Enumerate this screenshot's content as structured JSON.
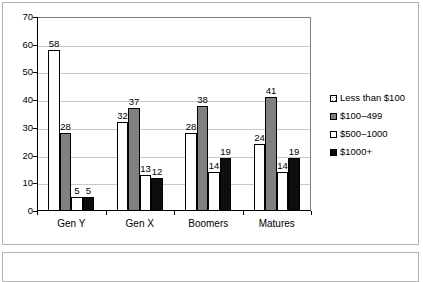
{
  "chart_data": {
    "type": "bar",
    "title": "",
    "subtitle": "",
    "xlabel": "",
    "ylabel": "",
    "ylim": [
      0,
      70
    ],
    "ytick_step": 10,
    "yticks": [
      "70",
      "60",
      "50",
      "40",
      "30",
      "20",
      "10",
      "0"
    ],
    "grid": true,
    "legend_position": "right",
    "categories": [
      "Gen Y",
      "Gen X",
      "Boomers",
      "Matures"
    ],
    "series": [
      {
        "name": "Less than $100",
        "swatch": "dotted-white",
        "color": "#ffffff",
        "values": [
          58,
          32,
          28,
          24
        ]
      },
      {
        "name": "$100–499",
        "swatch": "solid-gray",
        "color": "#808080",
        "values": [
          28,
          37,
          38,
          41
        ]
      },
      {
        "name": "$500–1000",
        "swatch": "solid-white",
        "color": "#ffffff",
        "values": [
          5,
          13,
          14,
          14
        ]
      },
      {
        "name": "$1000+",
        "swatch": "solid-black",
        "color": "#0d0d0d",
        "values": [
          5,
          12,
          19,
          19
        ]
      }
    ]
  },
  "figure": {
    "border_color": "#b3b3b3",
    "axis_color": "#000000",
    "gridline_color": "#c8c8c8",
    "plot_border_color": "#808080"
  },
  "caption_box": {
    "text": ""
  }
}
